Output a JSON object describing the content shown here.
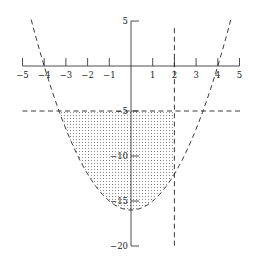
{
  "chart_data": {
    "type": "line",
    "title": "",
    "xlabel": "",
    "ylabel": "",
    "xlim": [
      -5,
      5
    ],
    "ylim": [
      -20,
      5
    ],
    "grid": false,
    "legend": null,
    "x_ticks": [
      -5,
      -4,
      -3,
      -2,
      -1,
      1,
      2,
      3,
      4,
      5
    ],
    "x_tick_labels": [
      "−5",
      "−4",
      "−3",
      "−2",
      "−1",
      "1",
      "2",
      "3",
      "4",
      "5"
    ],
    "y_ticks": [
      5,
      -5,
      -10,
      -15,
      -20
    ],
    "y_tick_labels": [
      "5",
      "−5",
      "−10",
      "−15",
      "−20"
    ],
    "series": [
      {
        "name": "parabola",
        "equation": "y = x^2 - 16",
        "style": "dashed",
        "x_range": [
          -4.6,
          4.6
        ],
        "x": [
          -4.6,
          -4,
          -3,
          -2,
          -1,
          0,
          1,
          2,
          3,
          4,
          4.6
        ],
        "y": [
          5.16,
          0,
          -7,
          -12,
          -15,
          -16,
          -15,
          -12,
          -7,
          0,
          5.16
        ]
      },
      {
        "name": "horizontal line",
        "equation": "y = -5",
        "style": "dashed",
        "x_range": [
          -5,
          5.1
        ]
      },
      {
        "name": "vertical line",
        "equation": "x = 2",
        "style": "dashed",
        "y_range": [
          -20.2,
          4.2
        ]
      }
    ],
    "shaded_region": {
      "description": "Region bounded above by y = -5, on the right by x = 2, and below by y = x^2 - 16",
      "pattern": "dots",
      "x_range": [
        -3.317,
        2
      ],
      "y_range": [
        -16,
        -5
      ]
    }
  }
}
